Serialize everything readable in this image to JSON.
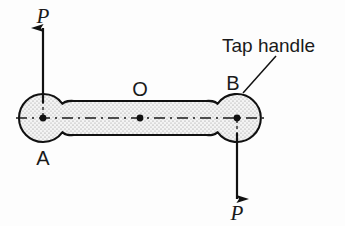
{
  "figure": {
    "background_color": "#fdfdfd",
    "outline_color": "#111111",
    "fill_color": "#f2f2f2",
    "stipple_color": "#8c8c8c",
    "centerline_color": "#1a1a1a"
  },
  "labels": {
    "force_top": "P",
    "force_bottom": "P",
    "point_a": "A",
    "point_b": "B",
    "point_o": "O",
    "callout": "Tap handle"
  },
  "geometry": {
    "bulb_a": {
      "cx": 43,
      "cy": 118,
      "r": 24
    },
    "bulb_b": {
      "cx": 237,
      "cy": 118,
      "r": 24
    },
    "shaft": {
      "x1": 43,
      "x2": 237,
      "top_y": 101,
      "bottom_y": 135
    },
    "centerline": {
      "y": 118,
      "x1": 16,
      "x2": 264
    },
    "arrow_top": {
      "x": 43,
      "y_tail": 101,
      "y_head": 26
    },
    "arrow_bottom": {
      "x": 237,
      "y_tail": 135,
      "y_head": 201
    },
    "leader_line": {
      "x1": 276,
      "y1": 56,
      "x2": 243,
      "y2": 93
    }
  },
  "icons": {
    "arrow_up": "arrow-up-icon",
    "arrow_down": "arrow-down-icon",
    "center_dot": "center-point-icon"
  }
}
